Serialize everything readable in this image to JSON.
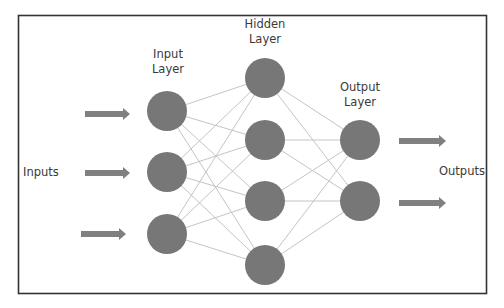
{
  "diagram": {
    "type": "neural-network",
    "labels": {
      "input_layer": "Input\nLayer",
      "hidden_layer": "Hidden\nLayer",
      "output_layer": "Output\nLayer",
      "inputs": "Inputs",
      "outputs": "Outputs"
    },
    "colors": {
      "node": "#777777",
      "edge": "#c4c4c4",
      "arrow": "#808080",
      "border": "#333333",
      "text": "#3a3a3a"
    },
    "layers": [
      {
        "name": "input",
        "nodes": [
          {
            "x": 167,
            "y": 111
          },
          {
            "x": 167,
            "y": 172
          },
          {
            "x": 167,
            "y": 234
          }
        ]
      },
      {
        "name": "hidden",
        "nodes": [
          {
            "x": 265,
            "y": 78
          },
          {
            "x": 265,
            "y": 140
          },
          {
            "x": 265,
            "y": 201
          },
          {
            "x": 265,
            "y": 265
          }
        ]
      },
      {
        "name": "output",
        "nodes": [
          {
            "x": 360,
            "y": 140
          },
          {
            "x": 360,
            "y": 201
          }
        ]
      }
    ],
    "node_radius": 20,
    "input_arrows": [
      {
        "x1": 85,
        "x2": 130,
        "y": 114
      },
      {
        "x1": 85,
        "x2": 130,
        "y": 173
      },
      {
        "x1": 81,
        "x2": 126,
        "y": 234
      }
    ],
    "output_arrows": [
      {
        "x1": 399,
        "x2": 446,
        "y": 141
      },
      {
        "x1": 399,
        "x2": 446,
        "y": 203
      }
    ]
  }
}
